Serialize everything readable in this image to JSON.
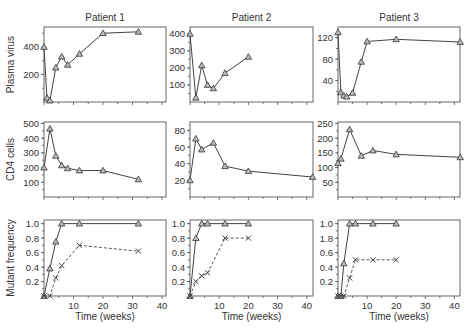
{
  "chart_data": {
    "type": "line",
    "layout": "3x3 small multiples",
    "columns": [
      "Patient 1",
      "Patient 2",
      "Patient 3"
    ],
    "rows": [
      "Plasma virus",
      "CD4 cells",
      "Mutant frequency"
    ],
    "xlabel": "Time (weeks)",
    "xlim": [
      0,
      42
    ],
    "xticks": [
      10,
      20,
      30,
      40
    ],
    "grid": false,
    "panels": [
      {
        "id": "p1-virus",
        "row": 0,
        "col": 0,
        "ylabel": "Plasma virus",
        "title": "Patient 1",
        "ylim": [
          0,
          545
        ],
        "yticks": [
          200,
          400
        ],
        "series": [
          {
            "name": "Plasma virus",
            "style": "solid",
            "marker": "triangle",
            "x": [
              0,
              1,
              2,
              4,
              6,
              8,
              12,
              20,
              32
            ],
            "y": [
              400,
              30,
              10,
              250,
              330,
              270,
              350,
              500,
              510
            ]
          }
        ]
      },
      {
        "id": "p2-virus",
        "row": 0,
        "col": 1,
        "title": "Patient 2",
        "ylim": [
          0,
          440
        ],
        "yticks": [
          100,
          200,
          300,
          400
        ],
        "series": [
          {
            "name": "Plasma virus",
            "style": "solid",
            "marker": "triangle",
            "x": [
              0,
              2,
              4,
              6,
              8,
              12,
              20
            ],
            "y": [
              400,
              25,
              215,
              100,
              80,
              170,
              265
            ]
          }
        ]
      },
      {
        "id": "p3-virus",
        "row": 0,
        "col": 2,
        "title": "Patient 3",
        "ylim": [
          0,
          140
        ],
        "yticks": [
          40,
          80,
          120
        ],
        "series": [
          {
            "name": "Plasma virus",
            "style": "solid",
            "marker": "triangle",
            "x": [
              0,
              1,
              2,
              3,
              5,
              8,
              10,
              20,
              42
            ],
            "y": [
              130,
              18,
              12,
              10,
              17,
              75,
              113,
              117,
              112
            ]
          }
        ]
      },
      {
        "id": "p1-cd4",
        "row": 1,
        "col": 0,
        "ylabel": "CD4 cells",
        "ylim": [
          0,
          510
        ],
        "yticks": [
          100,
          200,
          300,
          400,
          500
        ],
        "series": [
          {
            "name": "CD4 cells",
            "style": "solid",
            "marker": "triangle",
            "x": [
              0,
              2,
              4,
              6,
              8,
              12,
              20,
              32
            ],
            "y": [
              200,
              465,
              280,
              215,
              195,
              180,
              180,
              120
            ]
          }
        ]
      },
      {
        "id": "p2-cd4",
        "row": 1,
        "col": 1,
        "ylim": [
          0,
          90
        ],
        "yticks": [
          20,
          40,
          60,
          80
        ],
        "series": [
          {
            "name": "CD4 cells",
            "style": "solid",
            "marker": "triangle",
            "x": [
              0,
              2,
              4,
              8,
              12,
              20,
              42
            ],
            "y": [
              20,
              70,
              57,
              65,
              37,
              31,
              24
            ]
          }
        ]
      },
      {
        "id": "p3-cd4",
        "row": 1,
        "col": 2,
        "ylim": [
          0,
          255
        ],
        "yticks": [
          50,
          100,
          150,
          200,
          250
        ],
        "series": [
          {
            "name": "CD4 cells",
            "style": "solid",
            "marker": "triangle",
            "x": [
              0,
              1,
              4,
              8,
              12,
              20,
              42
            ],
            "y": [
              115,
              130,
              230,
              140,
              158,
              145,
              135
            ]
          }
        ]
      },
      {
        "id": "p1-mutant",
        "row": 2,
        "col": 0,
        "ylabel": "Mutant frequency",
        "ylim": [
          0,
          1.05
        ],
        "yticks": [
          0.2,
          0.4,
          0.6,
          0.8,
          1.0
        ],
        "series": [
          {
            "name": "Mutant (triangle)",
            "style": "solid",
            "marker": "triangle",
            "x": [
              0,
              2,
              4,
              6,
              12,
              32
            ],
            "y": [
              0,
              0.38,
              0.75,
              1.0,
              1.0,
              1.0
            ]
          },
          {
            "name": "Mutant (cross)",
            "style": "dashed",
            "marker": "cross",
            "x": [
              0,
              2,
              4,
              6,
              12,
              32
            ],
            "y": [
              0,
              0,
              0.25,
              0.42,
              0.7,
              0.62
            ]
          }
        ]
      },
      {
        "id": "p2-mutant",
        "row": 2,
        "col": 1,
        "ylim": [
          0,
          1.05
        ],
        "yticks": [
          0.2,
          0.4,
          0.6,
          0.8,
          1.0
        ],
        "series": [
          {
            "name": "Mutant (triangle)",
            "style": "solid",
            "marker": "triangle",
            "x": [
              0,
              2,
              4,
              6,
              12,
              20
            ],
            "y": [
              0,
              0.8,
              1.0,
              1.0,
              1.0,
              1.0
            ]
          },
          {
            "name": "Mutant (cross)",
            "style": "dashed",
            "marker": "cross",
            "x": [
              0,
              2,
              4,
              6,
              12,
              20
            ],
            "y": [
              0,
              0.2,
              0.28,
              0.32,
              0.8,
              0.8
            ]
          }
        ]
      },
      {
        "id": "p3-mutant",
        "row": 2,
        "col": 2,
        "ylim": [
          0,
          1.05
        ],
        "yticks": [
          0.2,
          0.4,
          0.6,
          0.8,
          1.0
        ],
        "ytick_labels": [
          "0.2",
          "0.4",
          "0.6",
          "1.8",
          "1.0"
        ],
        "series": [
          {
            "name": "Mutant (triangle)",
            "style": "solid",
            "marker": "triangle",
            "x": [
              0,
              1,
              2,
              4,
              6,
              12,
              20
            ],
            "y": [
              0,
              0,
              0.45,
              1.0,
              1.0,
              1.0,
              1.0
            ]
          },
          {
            "name": "Mutant (cross)",
            "style": "dashed",
            "marker": "cross",
            "x": [
              0,
              1,
              2,
              4,
              6,
              12,
              20
            ],
            "y": [
              0,
              0,
              0,
              0.25,
              0.5,
              0.5,
              0.5
            ]
          }
        ]
      }
    ]
  }
}
